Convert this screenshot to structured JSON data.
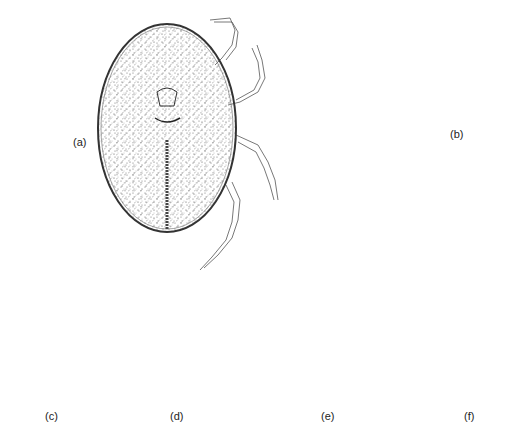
{
  "figure": {
    "panels": [
      {
        "id": "a",
        "label": "(a)",
        "description": "dorsal view of mite with legs"
      },
      {
        "id": "b",
        "label": "(b)",
        "description": "ventral view of mite"
      },
      {
        "id": "c",
        "label": "(c)",
        "description": "cuticle section with large pores"
      },
      {
        "id": "d",
        "label": "(d)",
        "description": "cuticle section with striations and small pores"
      },
      {
        "id": "e",
        "label": "(e)",
        "description": "seta/organ detail with two setae"
      },
      {
        "id": "f",
        "label": "(f)",
        "description": "bilobed seta/organ detail with two setae"
      }
    ],
    "colors": {
      "ink": "#333333",
      "background": "#ffffff"
    }
  }
}
